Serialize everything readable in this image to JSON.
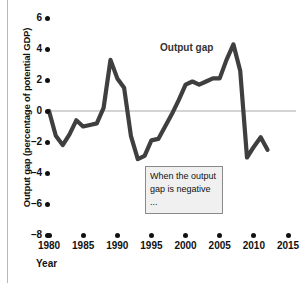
{
  "chart_data": {
    "type": "line",
    "title": "",
    "subtitle": "",
    "xlabel": "Year",
    "ylabel": "Output gap (percentage of potential GDP)",
    "xlim": [
      1980,
      2015
    ],
    "ylim": [
      -8,
      6
    ],
    "yticks": [
      6,
      4,
      2,
      0,
      -2,
      -4,
      -6,
      -8
    ],
    "ytick_labels": [
      "6",
      "4",
      "2",
      "0",
      "–2",
      "–4",
      "–6",
      "–8"
    ],
    "xticks": [
      1980,
      1985,
      1990,
      1995,
      2000,
      2005,
      2010,
      2015
    ],
    "xtick_labels": [
      "1980",
      "1985",
      "1990",
      "1995",
      "2000",
      "2005",
      "2010",
      "2015"
    ],
    "grid": false,
    "zero_line": true,
    "legend_position": "inline-label",
    "series": [
      {
        "name": "Output gap",
        "color": "#3f3f3f",
        "x": [
          1980,
          1981,
          1982,
          1983,
          1984,
          1985,
          1986,
          1987,
          1988,
          1989,
          1990,
          1991,
          1992,
          1993,
          1994,
          1995,
          1996,
          1997,
          1998,
          1999,
          2000,
          2001,
          2002,
          2003,
          2004,
          2005,
          2006,
          2007,
          2008,
          2009,
          2010,
          2011,
          2012
        ],
        "values": [
          0.0,
          -1.6,
          -2.2,
          -1.5,
          -0.6,
          -1.0,
          -0.9,
          -0.8,
          0.2,
          3.3,
          2.1,
          1.5,
          -1.6,
          -3.1,
          -2.9,
          -1.9,
          -1.8,
          -1.0,
          -0.2,
          0.7,
          1.7,
          1.9,
          1.7,
          1.9,
          2.1,
          2.1,
          3.3,
          4.3,
          2.6,
          -3.0,
          -2.3,
          -1.7,
          -2.5
        ]
      }
    ],
    "annotations": [
      {
        "name": "negative-output-gap-note",
        "lines": [
          "When the output",
          "gap is negative ..."
        ],
        "x": 1995,
        "y": -4.0
      }
    ],
    "series_label": "Output gap"
  },
  "axes": {
    "y_title": "Output gap (percentage of potential GDP)",
    "x_title": "Year"
  },
  "colors": {
    "line": "#3f3f3f",
    "zero_line": "#a9a9a9",
    "tick": "#111111",
    "annotation_fill": "#f0f0f0",
    "annotation_border": "#8a8a8a",
    "background": "#ffffff",
    "left_rule": "#b9b9b9"
  }
}
